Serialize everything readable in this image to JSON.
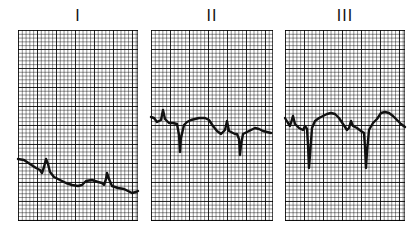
{
  "figure": {
    "leads": [
      {
        "label": "I",
        "label_x": 78
      },
      {
        "label": "II",
        "label_x": 212
      },
      {
        "label": "III",
        "label_x": 345
      }
    ]
  },
  "chart_data": {
    "type": "line",
    "title": "",
    "grid": true,
    "series": [
      {
        "name": "I",
        "panel": {
          "x": 18,
          "y": 30,
          "width": 120,
          "height": 191
        },
        "points": [
          [
            0,
            129
          ],
          [
            6,
            130
          ],
          [
            12,
            134
          ],
          [
            18,
            138
          ],
          [
            22,
            140
          ],
          [
            24,
            143
          ],
          [
            26,
            137
          ],
          [
            28,
            129
          ],
          [
            30,
            134
          ],
          [
            32,
            142
          ],
          [
            36,
            147
          ],
          [
            42,
            150
          ],
          [
            48,
            153
          ],
          [
            54,
            155
          ],
          [
            60,
            156
          ],
          [
            64,
            155
          ],
          [
            68,
            151
          ],
          [
            74,
            150
          ],
          [
            80,
            152
          ],
          [
            84,
            153
          ],
          [
            86,
            155
          ],
          [
            88,
            149
          ],
          [
            89,
            143
          ],
          [
            91,
            149
          ],
          [
            94,
            156
          ],
          [
            100,
            158
          ],
          [
            106,
            159
          ],
          [
            110,
            161
          ],
          [
            114,
            163
          ],
          [
            118,
            162
          ],
          [
            120,
            161
          ]
        ]
      },
      {
        "name": "II",
        "panel": {
          "x": 151,
          "y": 30,
          "width": 122,
          "height": 191
        },
        "points": [
          [
            0,
            87
          ],
          [
            3,
            88
          ],
          [
            6,
            92
          ],
          [
            10,
            90
          ],
          [
            12,
            80
          ],
          [
            14,
            89
          ],
          [
            18,
            93
          ],
          [
            22,
            93
          ],
          [
            26,
            94
          ],
          [
            28,
            105
          ],
          [
            29,
            122
          ],
          [
            30,
            108
          ],
          [
            33,
            95
          ],
          [
            36,
            92
          ],
          [
            40,
            90
          ],
          [
            44,
            89
          ],
          [
            48,
            88
          ],
          [
            54,
            88
          ],
          [
            58,
            90
          ],
          [
            62,
            96
          ],
          [
            66,
            101
          ],
          [
            70,
            104
          ],
          [
            74,
            100
          ],
          [
            76,
            91
          ],
          [
            78,
            101
          ],
          [
            82,
            103
          ],
          [
            84,
            104
          ],
          [
            86,
            104
          ],
          [
            88,
            109
          ],
          [
            89,
            125
          ],
          [
            90,
            115
          ],
          [
            92,
            104
          ],
          [
            96,
            102
          ],
          [
            100,
            100
          ],
          [
            104,
            98
          ],
          [
            108,
            99
          ],
          [
            112,
            101
          ],
          [
            116,
            102
          ],
          [
            120,
            103
          ]
        ]
      },
      {
        "name": "III",
        "panel": {
          "x": 285,
          "y": 30,
          "width": 120,
          "height": 191
        },
        "points": [
          [
            0,
            88
          ],
          [
            3,
            93
          ],
          [
            5,
            96
          ],
          [
            8,
            86
          ],
          [
            10,
            94
          ],
          [
            14,
            98
          ],
          [
            18,
            100
          ],
          [
            20,
            96
          ],
          [
            22,
            99
          ],
          [
            23,
            115
          ],
          [
            24,
            138
          ],
          [
            25,
            125
          ],
          [
            27,
            98
          ],
          [
            30,
            91
          ],
          [
            34,
            88
          ],
          [
            38,
            86
          ],
          [
            42,
            84
          ],
          [
            46,
            83
          ],
          [
            50,
            84
          ],
          [
            54,
            88
          ],
          [
            58,
            94
          ],
          [
            62,
            100
          ],
          [
            64,
            98
          ],
          [
            66,
            91
          ],
          [
            68,
            96
          ],
          [
            72,
            98
          ],
          [
            76,
            101
          ],
          [
            79,
            103
          ],
          [
            80,
            117
          ],
          [
            81,
            138
          ],
          [
            82,
            122
          ],
          [
            84,
            100
          ],
          [
            88,
            93
          ],
          [
            92,
            89
          ],
          [
            96,
            83
          ],
          [
            100,
            82
          ],
          [
            104,
            83
          ],
          [
            108,
            86
          ],
          [
            112,
            90
          ],
          [
            116,
            94
          ],
          [
            120,
            97
          ]
        ]
      }
    ],
    "xlabel": "",
    "ylabel": ""
  }
}
